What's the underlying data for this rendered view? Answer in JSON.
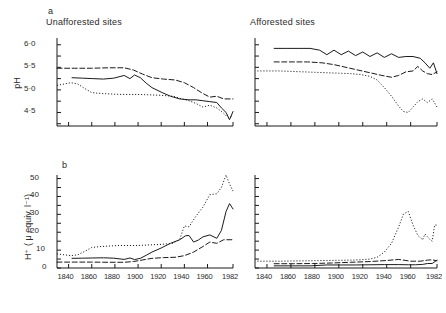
{
  "figure": {
    "panels": [
      {
        "letter": "a",
        "title": "Unafforested sites"
      },
      {
        "letter": "",
        "title": "Afforested sites"
      }
    ],
    "panel_b_letter": "b"
  },
  "axes": {
    "ph_label": "pH",
    "h_label": "H⁺ ( μ equiv. l⁻¹)",
    "ph_ticks": [
      "6·0",
      "5·5",
      "5·0",
      "4·5"
    ],
    "h_ticks": [
      "50",
      "40",
      "30",
      "20",
      "10",
      "0"
    ],
    "x_ticks": [
      "1840",
      "1860",
      "1880",
      "1900",
      "1920",
      "1940",
      "1960",
      "1982"
    ]
  },
  "chart_data": [
    {
      "type": "line",
      "panel": "a-left",
      "title": "Unafforested sites",
      "xlabel": "",
      "ylabel": "pH",
      "xlim": [
        1830,
        1982
      ],
      "ylim": [
        4.2,
        6.15
      ],
      "grid": false,
      "legend": "none",
      "series": [
        {
          "name": "site-1-solid",
          "style": "solid",
          "x": [
            1843,
            1852,
            1861,
            1870,
            1879,
            1888,
            1893,
            1897,
            1902,
            1907,
            1912,
            1920,
            1928,
            1936,
            1944,
            1950,
            1956,
            1962,
            1968,
            1972,
            1976,
            1979,
            1982
          ],
          "values": [
            5.27,
            5.26,
            5.25,
            5.24,
            5.26,
            5.32,
            5.25,
            5.33,
            5.27,
            5.15,
            5.05,
            4.95,
            4.86,
            4.8,
            4.78,
            4.78,
            4.76,
            4.74,
            4.72,
            4.6,
            4.5,
            4.34,
            4.52
          ]
        },
        {
          "name": "site-2-dashed",
          "style": "dashed",
          "x": [
            1830,
            1845,
            1860,
            1875,
            1888,
            1896,
            1904,
            1912,
            1922,
            1932,
            1940,
            1948,
            1956,
            1962,
            1968,
            1974,
            1982
          ],
          "values": [
            5.48,
            5.48,
            5.48,
            5.49,
            5.49,
            5.44,
            5.35,
            5.27,
            5.24,
            5.22,
            5.16,
            5.05,
            4.92,
            4.84,
            4.86,
            4.8,
            4.8
          ]
        },
        {
          "name": "site-3-dotted",
          "style": "dotted",
          "x": [
            1830,
            1836,
            1842,
            1848,
            1854,
            1860,
            1868,
            1876,
            1884,
            1892,
            1900,
            1910,
            1920,
            1930,
            1938,
            1944,
            1950,
            1956,
            1962,
            1968,
            1974,
            1978,
            1982
          ],
          "values": [
            5.1,
            5.13,
            5.16,
            5.13,
            5.03,
            4.94,
            4.92,
            4.91,
            4.9,
            4.9,
            4.9,
            4.89,
            4.88,
            4.86,
            4.8,
            4.76,
            4.7,
            4.62,
            4.66,
            4.6,
            4.48,
            4.38,
            4.42
          ]
        }
      ]
    },
    {
      "type": "line",
      "panel": "a-right",
      "title": "Afforested sites",
      "xlabel": "",
      "ylabel": "pH",
      "xlim": [
        1830,
        1982
      ],
      "ylim": [
        4.2,
        6.15
      ],
      "grid": false,
      "legend": "none",
      "series": [
        {
          "name": "site-1-solid",
          "style": "solid",
          "x": [
            1846,
            1856,
            1866,
            1876,
            1884,
            1890,
            1896,
            1902,
            1908,
            1914,
            1920,
            1926,
            1932,
            1938,
            1944,
            1950,
            1956,
            1962,
            1968,
            1972,
            1976,
            1979,
            1982
          ],
          "values": [
            5.92,
            5.92,
            5.92,
            5.92,
            5.88,
            5.78,
            5.88,
            5.78,
            5.86,
            5.76,
            5.84,
            5.74,
            5.82,
            5.72,
            5.8,
            5.72,
            5.74,
            5.74,
            5.7,
            5.6,
            5.48,
            5.6,
            5.36
          ]
        },
        {
          "name": "site-2-dashed",
          "style": "dashed",
          "x": [
            1846,
            1860,
            1874,
            1886,
            1896,
            1906,
            1916,
            1926,
            1936,
            1944,
            1950,
            1956,
            1962,
            1966,
            1970,
            1974,
            1978,
            1982
          ],
          "values": [
            5.62,
            5.62,
            5.62,
            5.6,
            5.56,
            5.5,
            5.44,
            5.38,
            5.32,
            5.28,
            5.32,
            5.4,
            5.42,
            5.52,
            5.42,
            5.36,
            5.34,
            5.4
          ]
        },
        {
          "name": "site-3-dotted",
          "style": "dotted",
          "x": [
            1832,
            1840,
            1850,
            1860,
            1870,
            1880,
            1890,
            1900,
            1910,
            1918,
            1926,
            1932,
            1938,
            1944,
            1950,
            1954,
            1958,
            1962,
            1966,
            1970,
            1974,
            1978,
            1982
          ],
          "values": [
            5.42,
            5.42,
            5.42,
            5.41,
            5.4,
            5.39,
            5.38,
            5.37,
            5.36,
            5.34,
            5.3,
            5.22,
            5.05,
            4.86,
            4.64,
            4.52,
            4.5,
            4.62,
            4.74,
            4.8,
            4.72,
            4.8,
            4.62
          ]
        }
      ]
    },
    {
      "type": "line",
      "panel": "b-left",
      "title": "Unafforested sites",
      "xlabel": "",
      "ylabel": "H⁺ ( μ equiv. l⁻¹)",
      "xlim": [
        1830,
        1982
      ],
      "ylim": [
        0,
        52
      ],
      "grid": false,
      "legend": "none",
      "series": [
        {
          "name": "site-1-solid",
          "style": "solid",
          "x": [
            1843,
            1852,
            1861,
            1870,
            1879,
            1888,
            1893,
            1897,
            1902,
            1907,
            1912,
            1920,
            1928,
            1936,
            1941,
            1944,
            1948,
            1952,
            1956,
            1962,
            1968,
            1972,
            1976,
            1979,
            1982
          ],
          "values": [
            5.4,
            5.5,
            5.6,
            5.7,
            5.5,
            4.8,
            5.6,
            4.7,
            5.4,
            7.1,
            8.9,
            11.2,
            13.8,
            15.8,
            18.0,
            18.2,
            14.5,
            15.6,
            17.4,
            18.5,
            16.6,
            21.0,
            31.6,
            36.0,
            33.0
          ]
        },
        {
          "name": "site-2-dashed",
          "style": "dashed",
          "x": [
            1830,
            1845,
            1860,
            1875,
            1888,
            1896,
            1904,
            1912,
            1922,
            1932,
            1940,
            1948,
            1956,
            1962,
            1968,
            1974,
            1982
          ],
          "values": [
            3.3,
            3.3,
            3.3,
            3.2,
            3.2,
            3.6,
            4.5,
            5.4,
            5.8,
            6.0,
            6.9,
            8.9,
            12.0,
            14.5,
            13.8,
            15.8,
            15.8
          ]
        },
        {
          "name": "site-3-dotted",
          "style": "dotted",
          "x": [
            1830,
            1836,
            1842,
            1848,
            1854,
            1860,
            1868,
            1876,
            1884,
            1892,
            1900,
            1910,
            1920,
            1930,
            1936,
            1940,
            1944,
            1950,
            1956,
            1962,
            1968,
            1972,
            1976,
            1979,
            1982
          ],
          "values": [
            7.9,
            7.4,
            6.9,
            7.4,
            9.3,
            11.5,
            12.0,
            12.3,
            12.6,
            12.6,
            12.6,
            12.9,
            13.2,
            13.8,
            16.0,
            23.5,
            23.0,
            29.0,
            34.0,
            41.0,
            41.5,
            45.0,
            52.0,
            47.0,
            43.0
          ]
        }
      ]
    },
    {
      "type": "line",
      "panel": "b-right",
      "title": "Afforested sites",
      "xlabel": "",
      "ylabel": "H⁺ ( μ equiv. l⁻¹)",
      "xlim": [
        1830,
        1982
      ],
      "ylim": [
        0,
        52
      ],
      "grid": false,
      "legend": "none",
      "series": [
        {
          "name": "site-1-solid",
          "style": "solid",
          "x": [
            1846,
            1860,
            1876,
            1890,
            1902,
            1914,
            1926,
            1938,
            1950,
            1958,
            1964,
            1970,
            1974,
            1978,
            1982
          ],
          "values": [
            1.2,
            1.2,
            1.2,
            1.7,
            1.7,
            1.7,
            1.8,
            1.9,
            1.9,
            1.8,
            1.8,
            2.0,
            2.5,
            2.5,
            4.4
          ]
        },
        {
          "name": "site-2-dashed",
          "style": "dashed",
          "x": [
            1846,
            1862,
            1878,
            1894,
            1910,
            1926,
            1940,
            1950,
            1960,
            1968,
            1974,
            1978,
            1982
          ],
          "values": [
            2.4,
            2.4,
            2.5,
            2.8,
            3.2,
            3.6,
            4.2,
            4.8,
            3.8,
            3.8,
            4.4,
            4.6,
            4.0
          ]
        },
        {
          "name": "site-3-dotted",
          "style": "dotted",
          "x": [
            1832,
            1840,
            1850,
            1860,
            1870,
            1880,
            1890,
            1900,
            1910,
            1918,
            1926,
            1932,
            1938,
            1944,
            1950,
            1954,
            1958,
            1962,
            1966,
            1970,
            1972,
            1976,
            1978,
            1980,
            1982
          ],
          "values": [
            3.8,
            3.8,
            3.8,
            3.9,
            4.0,
            4.1,
            4.2,
            4.3,
            4.4,
            4.6,
            5.0,
            6.0,
            8.9,
            13.8,
            23.0,
            30.2,
            31.6,
            24.0,
            18.2,
            15.8,
            19.0,
            16.0,
            15.0,
            24.0,
            24.0
          ]
        }
      ]
    }
  ]
}
